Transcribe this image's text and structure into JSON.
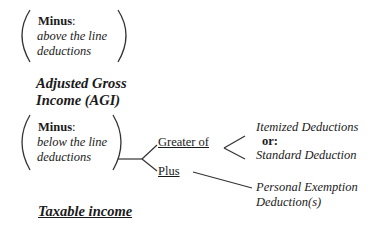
{
  "diagram": {
    "box1": {
      "label": "Minus",
      "colon": ":",
      "line1": "above the line",
      "line2": "deductions"
    },
    "agi": {
      "line1": "Adjusted Gross",
      "line2": "Income (AGI)"
    },
    "box2": {
      "label": "Minus",
      "colon": ":",
      "line1": "below the line",
      "line2": "deductions"
    },
    "branch_greater": "Greater of",
    "branch_plus": "Plus",
    "options": {
      "itemized": "Itemized Deductions",
      "or": "or:",
      "standard": "Standard Deduction"
    },
    "exemption": {
      "line1": "Personal Exemption",
      "line2": "Deduction(s)"
    },
    "result": "Taxable income"
  }
}
